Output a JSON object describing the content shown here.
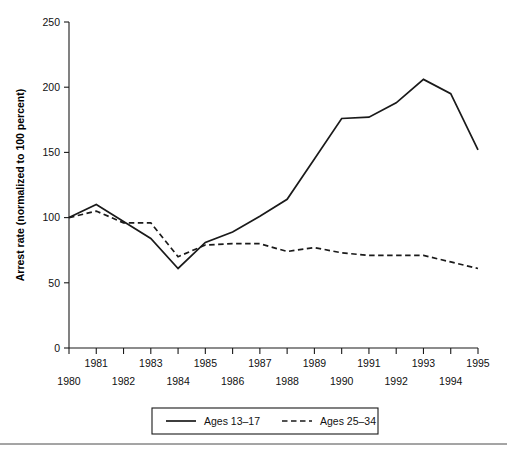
{
  "chart_data": {
    "type": "line",
    "title": "",
    "subtitle": "",
    "xlabel": "",
    "ylabel": "Arrest rate (normalized to 100 percent)",
    "x": [
      1980,
      1981,
      1982,
      1983,
      1984,
      1985,
      1986,
      1987,
      1988,
      1989,
      1990,
      1991,
      1992,
      1993,
      1994,
      1995
    ],
    "xtick_labels": [
      "1980",
      "1981",
      "1982",
      "1983",
      "1984",
      "1985",
      "1986",
      "1987",
      "1988",
      "1989",
      "1990",
      "1991",
      "1992",
      "1993",
      "1994",
      "1995"
    ],
    "ytick_labels": [
      "0",
      "50",
      "100",
      "150",
      "200",
      "250"
    ],
    "yticks": [
      0,
      50,
      100,
      150,
      200,
      250
    ],
    "xlim": [
      1980,
      1995
    ],
    "ylim": [
      0,
      250
    ],
    "grid": false,
    "legend_position": "bottom",
    "series": [
      {
        "name": "Ages 13–17",
        "style": "solid",
        "color": "#1a1a1a",
        "values": [
          100,
          110,
          97,
          84,
          61,
          81,
          89,
          101,
          114,
          145,
          176,
          177,
          188,
          206,
          195,
          152
        ]
      },
      {
        "name": "Ages 25–34",
        "style": "dashed",
        "color": "#1a1a1a",
        "values": [
          100,
          105,
          96,
          96,
          70,
          79,
          80,
          80,
          74,
          77,
          73,
          71,
          71,
          71,
          66,
          61
        ]
      }
    ]
  },
  "legend": {
    "entries": [
      {
        "label": "Ages 13–17",
        "style": "solid"
      },
      {
        "label": "Ages 25–34",
        "style": "dashed"
      }
    ]
  },
  "axes": {
    "y_title": "Arrest rate (normalized to 100 percent)"
  }
}
